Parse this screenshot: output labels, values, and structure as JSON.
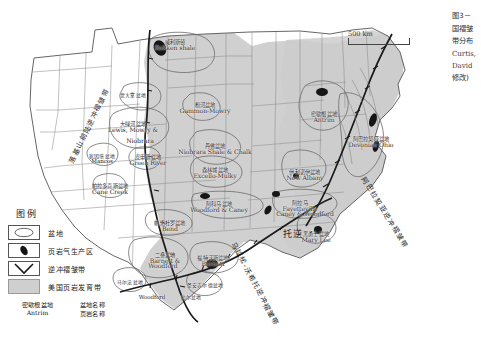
{
  "figure": {
    "caption_lines": [
      "图3－",
      "国褶皱",
      "带分布",
      "Curtis,",
      "David",
      "修改)"
    ],
    "scale_label": "500 km"
  },
  "legend": {
    "title": "图例",
    "items": [
      {
        "key": "basin-outline",
        "label": "盆地"
      },
      {
        "key": "shale-gas-production-area",
        "label": "页岩气生产区"
      },
      {
        "key": "thrust-fold-belt",
        "label": "逆冲褶皱带"
      },
      {
        "key": "us-shale-development-belt",
        "label": "美国页岩发育带"
      }
    ],
    "name_example": {
      "basin_cn": "密歇根盆地",
      "shale_en": "Antrim",
      "basin_caption": "盆地名称",
      "shale_caption": "页岩名称"
    }
  },
  "basins": [
    {
      "cn": "威利斯顿",
      "en": "Bakken shale",
      "x": 175,
      "y": 40,
      "size": "n"
    },
    {
      "cn": "蒙大拿盆地",
      "en": "",
      "x": 133,
      "y": 93,
      "size": "s"
    },
    {
      "cn": "粉河盆地",
      "en": "Gammon-Mowry",
      "x": 205,
      "y": 103,
      "size": "n"
    },
    {
      "cn": "大绿河盆地",
      "en": "Lewis, Mowry &",
      "x": 133,
      "y": 122,
      "size": "n"
    },
    {
      "cn": "",
      "en": "Niobrara",
      "x": 140,
      "y": 138,
      "size": "n"
    },
    {
      "cn": "犹因塔盆地",
      "en": "Mancos",
      "x": 102,
      "y": 154,
      "size": "s"
    },
    {
      "cn": "丹佛盆地",
      "en": "Niobrara Shale & Chalk",
      "x": 215,
      "y": 144,
      "size": "n"
    },
    {
      "cn": "皮申斯盆地",
      "en": "Green River",
      "x": 148,
      "y": 155,
      "size": "n"
    },
    {
      "cn": "帕拉多克斯盆地",
      "en": "Cane Creek",
      "x": 110,
      "y": 184,
      "size": "n"
    },
    {
      "cn": "森林城盆地",
      "en": "Excello-Mulky",
      "x": 215,
      "y": 168,
      "size": "n"
    },
    {
      "cn": "阿科马盆地",
      "en": "Woodford & Caney",
      "x": 219,
      "y": 202,
      "size": "n"
    },
    {
      "cn": "阿拉马",
      "en": "Fayetteville",
      "x": 300,
      "y": 201,
      "size": "n"
    },
    {
      "cn": "",
      "en": "Caney & Woodford",
      "x": 305,
      "y": 211,
      "size": "n"
    },
    {
      "cn": "帕洛杜罗盆地",
      "en": "Bend",
      "x": 170,
      "y": 221,
      "size": "n"
    },
    {
      "cn": "二叠盆地",
      "en": "Barnett &",
      "x": 165,
      "y": 253,
      "size": "n"
    },
    {
      "cn": "",
      "en": "Woodford",
      "x": 163,
      "y": 263,
      "size": "n"
    },
    {
      "cn": "福特沃斯盆地",
      "en": "Barnett",
      "x": 213,
      "y": 256,
      "size": "n"
    },
    {
      "cn": "马尔法盆地",
      "en": "",
      "x": 130,
      "y": 280,
      "size": "s"
    },
    {
      "cn": "圣安吉尔德盆地",
      "en": "",
      "x": 205,
      "y": 283,
      "size": "s"
    },
    {
      "cn": "",
      "en": "Woodford",
      "x": 152,
      "y": 295,
      "size": "s"
    },
    {
      "cn": "比尔盆地",
      "en": "",
      "x": 191,
      "y": 295,
      "size": "s"
    },
    {
      "cn": "密歇根盆地",
      "en": "Antrim",
      "x": 324,
      "y": 112,
      "size": "n"
    },
    {
      "cn": "阿巴拉契亚盆地",
      "en": "Devonian Ohio",
      "x": 371,
      "y": 137,
      "size": "n"
    },
    {
      "cn": "伊利诺伊盆地",
      "en": "New Albany",
      "x": 305,
      "y": 170,
      "size": "n"
    },
    {
      "cn": "黑勇士盆地",
      "en": "Mary Lee",
      "x": 316,
      "y": 232,
      "size": "n"
    }
  ],
  "rotated_labels": [
    {
      "text": "落基山前陆逆冲褶皱带",
      "x": 66,
      "y": 160,
      "rotate": -64
    },
    {
      "text": "阿巴拉契亚逆冲褶皱带",
      "x": 368,
      "y": 175,
      "rotate": 58
    },
    {
      "text": "马拉松-沃希托逆冲褶皱带",
      "x": 238,
      "y": 240,
      "rotate": 62
    },
    {
      "text": "托逆",
      "x": 283,
      "y": 227,
      "rotate": 0
    }
  ]
}
